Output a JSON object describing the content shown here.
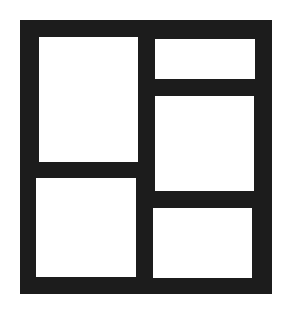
{
  "icon": {
    "name": "layout-grid-icon",
    "description": "Five-panel layout grid",
    "colors": {
      "stroke": "#1c1c1c",
      "fill": "#ffffff",
      "background": "#ffffff"
    },
    "frame": {
      "left": 20,
      "top": 20,
      "width": 252,
      "height": 274
    },
    "panes": [
      {
        "id": "left-top",
        "left": 39,
        "top": 37,
        "width": 99,
        "height": 125
      },
      {
        "id": "left-bottom",
        "left": 36,
        "top": 178,
        "width": 100,
        "height": 99
      },
      {
        "id": "right-top",
        "left": 155,
        "top": 39,
        "width": 100,
        "height": 40
      },
      {
        "id": "right-middle",
        "left": 155,
        "top": 96,
        "width": 99,
        "height": 95
      },
      {
        "id": "right-bottom",
        "left": 153,
        "top": 208,
        "width": 99,
        "height": 70
      }
    ]
  }
}
